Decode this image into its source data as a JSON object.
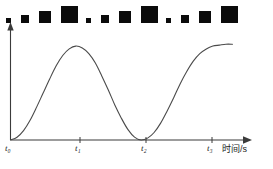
{
  "figure": {
    "title": "",
    "background_color": "#ffffff",
    "ink_color": "#3b3b3b",
    "square_color": "#0b0b0b"
  },
  "strobe": {
    "description": "strobe-photo strip of black squares of repeating increasing size",
    "count": 12,
    "squares": [
      {
        "x": 6,
        "size": 5,
        "label": "square-1"
      },
      {
        "x": 21,
        "size": 8,
        "label": "square-2"
      },
      {
        "x": 39,
        "size": 12,
        "label": "square-3"
      },
      {
        "x": 61,
        "size": 17,
        "label": "square-4"
      },
      {
        "x": 86,
        "size": 5,
        "label": "square-5"
      },
      {
        "x": 101,
        "size": 8,
        "label": "square-6"
      },
      {
        "x": 119,
        "size": 12,
        "label": "square-7"
      },
      {
        "x": 141,
        "size": 17,
        "label": "square-8"
      },
      {
        "x": 166,
        "size": 5,
        "label": "square-9"
      },
      {
        "x": 181,
        "size": 8,
        "label": "square-10"
      },
      {
        "x": 199,
        "size": 12,
        "label": "square-11"
      },
      {
        "x": 221,
        "size": 17,
        "label": "square-12"
      }
    ],
    "baseline_y": 23
  },
  "chart_data": {
    "type": "line",
    "title": "",
    "xlabel": "时间/s",
    "ylabel": "",
    "grid": false,
    "legend": null,
    "x_ticks": [
      {
        "label": "t",
        "sub": "0",
        "x_px": 10
      },
      {
        "label": "t",
        "sub": "1",
        "x_px": 80
      },
      {
        "label": "t",
        "sub": "2",
        "x_px": 146
      },
      {
        "label": "t",
        "sub": "3",
        "x_px": 212
      }
    ],
    "x_tick_labels": [
      "t₀",
      "t₁",
      "t₂",
      "t₃"
    ],
    "xlim": [
      0,
      3.6
    ],
    "ylim": [
      0,
      1.15
    ],
    "series": [
      {
        "name": "displacement",
        "x": [
          0.0,
          0.1,
          0.2,
          0.3,
          0.4,
          0.5,
          0.6,
          0.7,
          0.8,
          0.9,
          1.0,
          1.1,
          1.2,
          1.3,
          1.4,
          1.5,
          1.6,
          1.7,
          1.8,
          1.9,
          2.0,
          2.1,
          2.2,
          2.3,
          2.4,
          2.5,
          2.6,
          2.7,
          2.8,
          2.9,
          3.0,
          3.1,
          3.2,
          3.3,
          3.4
        ],
        "values": [
          0.0,
          0.03,
          0.1,
          0.21,
          0.35,
          0.5,
          0.65,
          0.79,
          0.9,
          0.97,
          1.0,
          0.98,
          0.92,
          0.82,
          0.68,
          0.53,
          0.37,
          0.23,
          0.11,
          0.03,
          0.0,
          0.02,
          0.08,
          0.18,
          0.31,
          0.45,
          0.6,
          0.73,
          0.84,
          0.92,
          0.97,
          1.0,
          1.01,
          1.02,
          1.02
        ]
      }
    ],
    "annotations": []
  },
  "axis": {
    "y_axis_name": "vertical-axis",
    "x_axis_name": "horizontal-time-axis",
    "x_axis_title": "时间/s"
  }
}
